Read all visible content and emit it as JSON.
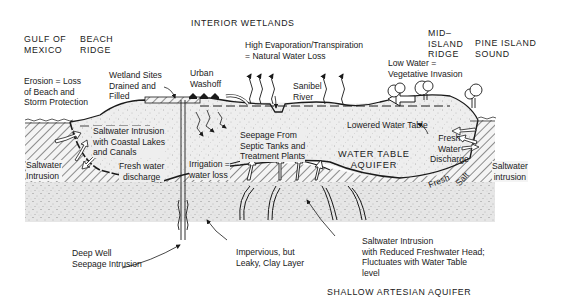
{
  "diagram": {
    "type": "hydrogeologic cross-section",
    "region_labels": {
      "gulf": "GULF OF\nMEXICO",
      "beach_ridge": "BEACH\nRIDGE",
      "interior_wetlands": "INTERIOR WETLANDS",
      "mid_island_ridge": "MID–\nISLAND\nRIDGE",
      "pine_island_sound": "PINE ISLAND\nSOUND",
      "water_table_aquifer": "WATER TABLE\nAQUIFER",
      "shallow_artesian_aquifer": "SHALLOW ARTESIAN AQUIFER"
    },
    "annotations": {
      "erosion": "Erosion = Loss\nof Beach and\nStorm Protection",
      "wetland_sites": "Wetland Sites\nDrained and\nFilled",
      "urban_washoff": "Urban\nWashoff",
      "evaporation": "High Evaporation/Transpiration\n= Natural Water Loss",
      "sanibel_river": "Sanibel\nRiver",
      "low_water": "Low Water =\nVegetative Invasion",
      "saltwater_coastal_lakes": "Saltwater Intrusion\nwith Coastal Lakes\nand Canals",
      "saltwater_intrusion_left": "Saltwater\nIntrusion",
      "fresh_water_discharge_left": "Fresh water\ndischarge",
      "seepage_septic": "Seepage From\nSeptic Tanks and\nTreatment Plants",
      "lowered_water_table": "Lowered Water Table",
      "irrigation": "Irrigation =\nwater loss",
      "fresh_water_discharge_right": "Fresh\nWater\nDischarge",
      "saltwater_intrusion_right": "Saltwater\nintrusion",
      "fresh": "Fresh",
      "salt": "Salt",
      "deep_well": "Deep Well\nSeepage Intrusion",
      "clay_layer": "Impervious, but\nLeaky, Clay Layer",
      "saltwater_reduced_head": "Saltwater Intrusion\nwith Reduced Freshwater Head;\nFluctuates with Water Table\nlevel"
    },
    "colors": {
      "ink": "#1a1a1a",
      "aquifer_fill": "#ececec",
      "artesian_fill": "#e2e2e2",
      "hatch": "#333333",
      "background": "#ffffff"
    }
  }
}
